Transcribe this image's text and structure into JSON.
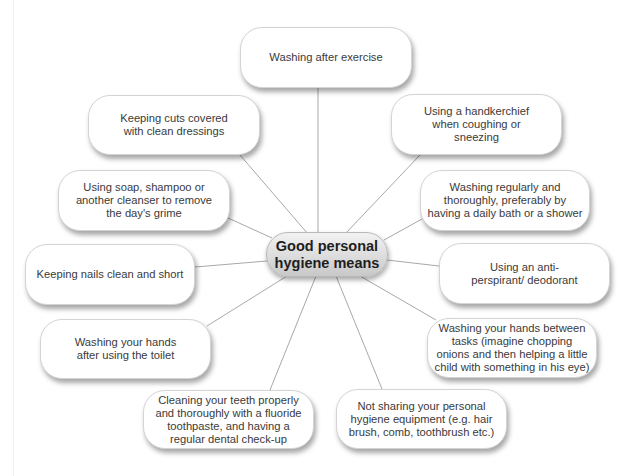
{
  "diagram": {
    "type": "mind-map",
    "center": {
      "line1": "Good personal",
      "line2": "hygiene means"
    },
    "colors": {
      "node_fill": "#ffffff",
      "node_border": "#d4d4d4",
      "line": "#a8a8a8",
      "hub_fill": "#d8d8d8",
      "text": "#3a3a3a"
    },
    "nodes": [
      {
        "id": "exercise",
        "text": "Washing after exercise"
      },
      {
        "id": "cuts",
        "text": "Keeping cuts covered with clean dressings"
      },
      {
        "id": "handkerchief",
        "text": "Using a handkerchief when coughing or sneezing"
      },
      {
        "id": "soap",
        "text": "Using soap, shampoo or another cleanser to remove the day's grime"
      },
      {
        "id": "washing",
        "text": "Washing regularly and thoroughly, preferably by having a daily bath or a shower"
      },
      {
        "id": "nails",
        "text": "Keeping nails clean and short"
      },
      {
        "id": "deodorant",
        "text": "Using an anti-perspirant/ deodorant"
      },
      {
        "id": "toilet",
        "text": "Washing your hands after using the toilet"
      },
      {
        "id": "tasks",
        "text": "Washing your hands between tasks (imagine chopping onions and then helping a little child with something in his eye)"
      },
      {
        "id": "teeth",
        "text": "Cleaning your teeth properly and thoroughly with a fluoride toothpaste, and having a regular dental check-up"
      },
      {
        "id": "sharing",
        "text": "Not sharing your personal hygiene equipment (e.g. hair brush, comb, toothbrush etc.)"
      }
    ]
  }
}
